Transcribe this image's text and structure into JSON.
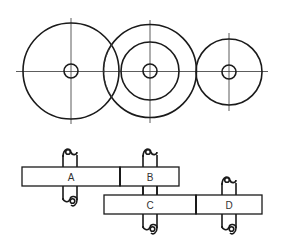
{
  "diagram": {
    "type": "gear-train",
    "end_view": {
      "gears": [
        {
          "id": "gear-1",
          "cx": 71,
          "cy": 71,
          "r_outer": 48,
          "r_hub": 7,
          "hidden_arc": true
        },
        {
          "id": "gear-2",
          "cx": 150,
          "cy": 71,
          "r_outer": 46,
          "r_inner": 29,
          "r_hub": 7
        },
        {
          "id": "gear-3",
          "cx": 229,
          "cy": 72,
          "r_outer": 33,
          "r_hub": 7
        }
      ]
    },
    "side_view": {
      "gears": [
        {
          "id": "A",
          "label": "A"
        },
        {
          "id": "B",
          "label": "B"
        },
        {
          "id": "C",
          "label": "C"
        },
        {
          "id": "D",
          "label": "D"
        }
      ],
      "shafts": [
        {
          "id": "shaft-1",
          "carries": [
            "A"
          ]
        },
        {
          "id": "shaft-2",
          "carries": [
            "B",
            "C"
          ]
        },
        {
          "id": "shaft-3",
          "carries": [
            "D"
          ]
        }
      ]
    },
    "colors": {
      "line": "#1a1a1a",
      "background": "#ffffff"
    }
  }
}
